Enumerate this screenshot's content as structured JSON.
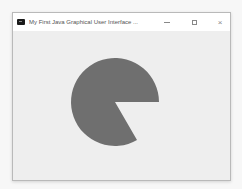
{
  "window": {
    "title": "My First Java Graphical User Interface ...",
    "controls": {
      "minimize": "minimize",
      "maximize": "maximize",
      "close": "×"
    }
  },
  "canvas": {
    "shape": "pie-arc",
    "fill_color": "#6f6f6f",
    "center": [
      102,
      71
    ],
    "radius": 44,
    "start_angle_deg": 0,
    "arc_extent_deg": 300
  },
  "colors": {
    "titlebar": "#ffffff",
    "client_background": "#eeeeee",
    "border": "#b9b9b9"
  }
}
